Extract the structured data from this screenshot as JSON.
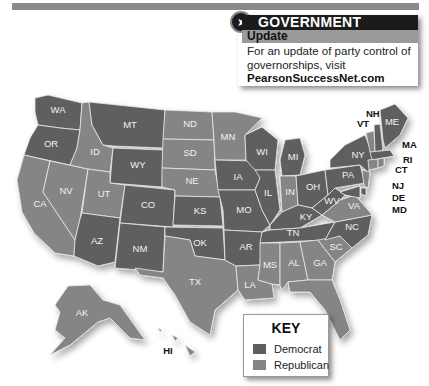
{
  "header": {
    "bar_color": "#8a8a8a"
  },
  "government_online": {
    "title_bold": "GOVERNMENT",
    "title_light": "ONLINE",
    "icon": "arrow-cursor-icon",
    "subtitle": "Update",
    "body_line1": "For an update of party control of",
    "body_line2": "governorships, visit",
    "link": "PearsonSuccessNet.com"
  },
  "key": {
    "title": "KEY",
    "items": [
      {
        "label": "Democrat",
        "color": "#5f5f5f"
      },
      {
        "label": "Republican",
        "color": "#858585"
      }
    ]
  },
  "states": {
    "WA": "Democrat",
    "OR": "Democrat",
    "MT": "Democrat",
    "WY": "Democrat",
    "CO": "Democrat",
    "KS": "Democrat",
    "NM": "Democrat",
    "OK": "Democrat",
    "AR": "Democrat",
    "MO": "Democrat",
    "IA": "Democrat",
    "WI": "Democrat",
    "IL": "Democrat",
    "MI": "Democrat",
    "OH": "Democrat",
    "KY": "Democrat",
    "TN": "Democrat",
    "WV": "Democrat",
    "PA": "Democrat",
    "NY": "Democrat",
    "NC": "Democrat",
    "ME": "Democrat",
    "NH": "Democrat",
    "MA": "Democrat",
    "AZ": "Democrat",
    "AK": "Republican",
    "CA": "Republican",
    "NV": "Republican",
    "ID": "Republican",
    "UT": "Republican",
    "ND": "Republican",
    "SD": "Republican",
    "NE": "Republican",
    "MN": "Republican",
    "TX": "Republican",
    "LA": "Republican",
    "MS": "Republican",
    "AL": "Republican",
    "GA": "Republican",
    "SC": "Republican",
    "FL": "Republican",
    "IN": "Republican",
    "VA": "Republican",
    "VT": "Republican",
    "CT": "Republican",
    "RI": "Republican",
    "NJ": "Republican",
    "DE": "Democrat",
    "MD": "Democrat",
    "HI": "Republican"
  },
  "labels": {
    "WA": "WA",
    "OR": "OR",
    "CA": "CA",
    "NV": "NV",
    "ID": "ID",
    "MT": "MT",
    "WY": "WY",
    "UT": "UT",
    "AZ": "AZ",
    "CO": "CO",
    "NM": "NM",
    "ND": "ND",
    "SD": "SD",
    "NE": "NE",
    "KS": "KS",
    "OK": "OK",
    "TX": "TX",
    "MN": "MN",
    "IA": "IA",
    "MO": "MO",
    "AR": "AR",
    "LA": "LA",
    "WI": "WI",
    "IL": "IL",
    "MI": "MI",
    "IN": "IN",
    "OH": "OH",
    "KY": "KY",
    "TN": "TN",
    "MS": "MS",
    "AL": "AL",
    "GA": "GA",
    "FL": "FL",
    "SC": "SC",
    "NC": "NC",
    "VA": "VA",
    "WV": "WV",
    "PA": "PA",
    "NY": "NY",
    "ME": "ME",
    "AK": "AK",
    "HI": "HI",
    "VT": "VT",
    "NH": "NH",
    "MA": "MA",
    "RI": "RI",
    "CT": "CT",
    "NJ": "NJ",
    "DE": "DE",
    "MD": "MD"
  }
}
